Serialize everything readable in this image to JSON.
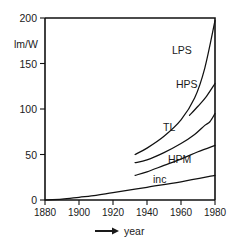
{
  "chart_data": {
    "type": "line",
    "title": "",
    "subtitle": "",
    "xlabel": "year",
    "ylabel": "lm/W",
    "xlim": [
      1880,
      1980
    ],
    "ylim": [
      0,
      200
    ],
    "grid": false,
    "legend_position": "inline-labels",
    "xticks": [
      1880,
      1900,
      1920,
      1940,
      1960,
      1980
    ],
    "xtick_labels": [
      "1880",
      "1900",
      "1920",
      "1940",
      "1960",
      "1980"
    ],
    "yticks": [
      0,
      50,
      100,
      150,
      200
    ],
    "ytick_labels": [
      "0",
      "50",
      "100",
      "150",
      "200"
    ],
    "series": [
      {
        "name": "LPS",
        "label": "LPS",
        "x": [
          1933,
          1940,
          1950,
          1960,
          1968,
          1974,
          1980
        ],
        "values": [
          50,
          57,
          70,
          88,
          112,
          145,
          197
        ]
      },
      {
        "name": "HPS",
        "label": "HPS",
        "x": [
          1965,
          1970,
          1975,
          1980
        ],
        "values": [
          93,
          103,
          114,
          128
        ]
      },
      {
        "name": "TL",
        "label": "TL",
        "x": [
          1933,
          1940,
          1950,
          1960,
          1968,
          1974,
          1977,
          1980
        ],
        "values": [
          41,
          44,
          52,
          62,
          72,
          82,
          86,
          95
        ]
      },
      {
        "name": "HPM",
        "label": "HPM",
        "x": [
          1933,
          1940,
          1950,
          1960,
          1970,
          1980
        ],
        "values": [
          27,
          31,
          38,
          45,
          53,
          60
        ]
      },
      {
        "name": "inc",
        "label": "inc",
        "x": [
          1880,
          1890,
          1900,
          1910,
          1920,
          1940,
          1960,
          1980
        ],
        "values": [
          0,
          1,
          3,
          5,
          8,
          14,
          20,
          27
        ]
      }
    ]
  },
  "axis": {
    "y_unit": "lm/W",
    "x_title": "year",
    "x_arrow": "➡"
  },
  "colors": {
    "line": "#111111",
    "background": "#ffffff",
    "text": "#1a1a1a"
  }
}
